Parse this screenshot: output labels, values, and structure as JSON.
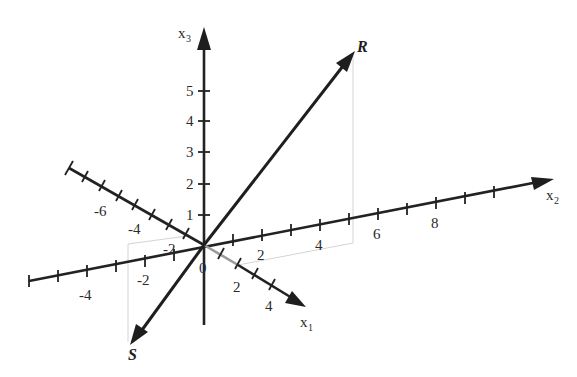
{
  "diagram": {
    "origin_label": "0",
    "axes": {
      "x1": {
        "label": "x",
        "subscript": "1",
        "tick_labels": [
          {
            "value": "-6",
            "x": 98,
            "y": 214
          },
          {
            "value": "-4",
            "x": 132,
            "y": 232
          },
          {
            "value": "-2",
            "x": 163,
            "y": 249
          },
          {
            "value": "2",
            "x": 233,
            "y": 293
          },
          {
            "value": "4",
            "x": 265,
            "y": 312
          }
        ]
      },
      "x2": {
        "label": "x",
        "subscript": "2",
        "tick_labels": [
          {
            "value": "-4",
            "x": 79,
            "y": 300
          },
          {
            "value": "-2",
            "x": 137,
            "y": 287
          },
          {
            "value": "2",
            "x": 257,
            "y": 258
          },
          {
            "value": "4",
            "x": 315,
            "y": 248
          },
          {
            "value": "6",
            "x": 373,
            "y": 238
          },
          {
            "value": "8",
            "x": 431,
            "y": 228
          }
        ]
      },
      "x3": {
        "label": "x",
        "subscript": "3",
        "tick_labels": [
          {
            "value": "1",
            "x": 186,
            "y": 220
          },
          {
            "value": "2",
            "x": 186,
            "y": 189
          },
          {
            "value": "3",
            "x": 186,
            "y": 157
          },
          {
            "value": "4",
            "x": 186,
            "y": 126
          },
          {
            "value": "5",
            "x": 186,
            "y": 96
          }
        ]
      }
    },
    "vectors": [
      {
        "name": "R",
        "label": "R"
      },
      {
        "name": "S",
        "label": "S"
      }
    ],
    "colors": {
      "axis": "#222222",
      "hidden_axis": "#9a9a9a",
      "projection": "#d4d4d4",
      "text": "#2a2a2a"
    }
  }
}
